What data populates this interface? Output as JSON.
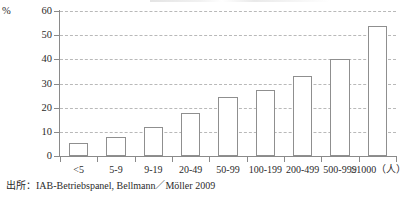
{
  "chart_data": {
    "type": "bar",
    "title": "",
    "subtitle": "",
    "xlabel": "",
    "ylabel": "%",
    "unit_suffix": "（人）",
    "categories": [
      "<5",
      "5-9",
      "9-19",
      "20-49",
      "50-99",
      "100-199",
      "200-499",
      "500-999",
      "≥1000（人）"
    ],
    "values": [
      5.5,
      8,
      12,
      18,
      24.5,
      27.5,
      33,
      40,
      54
    ],
    "ylim": [
      0,
      60
    ],
    "y_ticks": [
      0,
      10,
      20,
      30,
      40,
      50,
      60
    ],
    "y_tick_labels": [
      "0",
      "10",
      "20",
      "30",
      "40",
      "50",
      "60"
    ],
    "grid": true,
    "grid_axis": "y",
    "grid_style": "dashed",
    "legend": "none",
    "bar_fill": "#ffffff",
    "bar_edge": "#8f8f8f",
    "axis_color": "#8a8a8a",
    "grid_color": "#b9b9b9",
    "text_color": "#2b2b2b"
  },
  "axes": {
    "y_unit_label": "%"
  },
  "footer": {
    "source_note": "出所：IAB-Betriebspanel, Bellmann／Möller 2009"
  }
}
